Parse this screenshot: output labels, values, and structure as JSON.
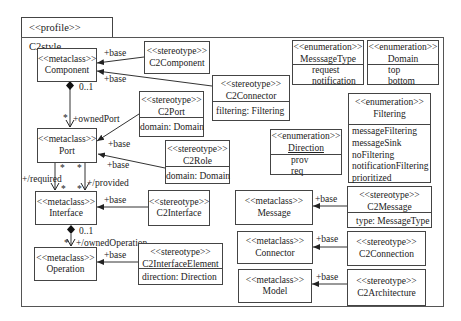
{
  "profile": {
    "tab_label": "<<profile>> C2style"
  },
  "metaclasses": [
    {
      "id": "component",
      "stereotype": "<<metaclass>>",
      "name": "Component"
    },
    {
      "id": "port",
      "stereotype": "<<metaclass>>",
      "name": "Port"
    },
    {
      "id": "interface",
      "stereotype": "<<metaclass>>",
      "name": "Interface"
    },
    {
      "id": "operation",
      "stereotype": "<<metaclass>>",
      "name": "Operation"
    },
    {
      "id": "message",
      "stereotype": "<<metaclass>>",
      "name": "Message"
    },
    {
      "id": "connector",
      "stereotype": "<<metaclass>>",
      "name": "Connector"
    },
    {
      "id": "model",
      "stereotype": "<<metaclass>>",
      "name": "Model"
    }
  ],
  "stereotypes": [
    {
      "id": "c2component",
      "stereotype": "<<stereotype>>",
      "name": "C2Component",
      "attributes": []
    },
    {
      "id": "c2connector",
      "stereotype": "<<stereotype>>",
      "name": "C2Connector",
      "attributes": [
        "filtering: Filtering"
      ]
    },
    {
      "id": "c2port",
      "stereotype": "<<stereotype>>",
      "name": "C2Port",
      "attributes": [
        "domain: Domain"
      ]
    },
    {
      "id": "c2role",
      "stereotype": "<<stereotype>>",
      "name": "C2Role",
      "attributes": [
        "domain: Domain"
      ]
    },
    {
      "id": "c2interface",
      "stereotype": "<<stereotype>>",
      "name": "C2Interface",
      "attributes": []
    },
    {
      "id": "c2interfaceelement",
      "stereotype": "<<stereotype>>",
      "name": "C2InterfaceElement",
      "attributes": [
        "direction: Direction"
      ]
    },
    {
      "id": "c2message",
      "stereotype": "<<stereotype>>",
      "name": "C2Message",
      "attributes": [
        "type: MessageType"
      ]
    },
    {
      "id": "c2connection",
      "stereotype": "<<stereotype>>",
      "name": "C2Connection",
      "attributes": []
    },
    {
      "id": "c2architecture",
      "stereotype": "<<stereotype>>",
      "name": "C2Architecture",
      "attributes": []
    }
  ],
  "enumerations": [
    {
      "id": "messagetype",
      "stereotype": "<<enumeration>>",
      "name": "MesssageType",
      "literals": [
        "request",
        "notification"
      ]
    },
    {
      "id": "domain",
      "stereotype": "<<enumeration>>",
      "name": "Domain",
      "literals": [
        "top",
        "bottom"
      ]
    },
    {
      "id": "filtering",
      "stereotype": "<<enumeration>>",
      "name": "Filtering",
      "literals": [
        "messageFiltering",
        "messageSink",
        "noFiltering",
        "notificationFiltering",
        "prioritized"
      ]
    },
    {
      "id": "direction",
      "stereotype": "<<enumeration>>",
      "name": "Direction",
      "literals": [
        "prov",
        "req"
      ]
    }
  ],
  "extensions": [
    {
      "from": "C2Component",
      "to": "Component",
      "label": "+base"
    },
    {
      "from": "C2Connector",
      "to": "Component",
      "label": "+base"
    },
    {
      "from": "C2Port",
      "to": "Port",
      "label": "+base"
    },
    {
      "from": "C2Role",
      "to": "Port",
      "label": "+base"
    },
    {
      "from": "C2Interface",
      "to": "Interface",
      "label": "+base"
    },
    {
      "from": "C2InterfaceElement",
      "to": "Operation",
      "label": "+base"
    },
    {
      "from": "C2Message",
      "to": "Message",
      "label": "+base"
    },
    {
      "from": "C2Connection",
      "to": "Connector",
      "label": "+base"
    },
    {
      "from": "C2Architecture",
      "to": "Model",
      "label": "+base"
    }
  ],
  "associations": {
    "owned_port": {
      "from": "Component",
      "to": "Port",
      "source_multiplicity": "0..1",
      "target_multiplicity": "*",
      "role": "+ownedPort"
    },
    "required": {
      "from": "Port",
      "to": "Interface",
      "source_multiplicity": "*",
      "target_multiplicity": "*",
      "role": "+/required"
    },
    "provided": {
      "from": "Port",
      "to": "Interface",
      "source_multiplicity": "*",
      "target_multiplicity": "*",
      "role": "+/provided"
    },
    "owned_operation": {
      "from": "Interface",
      "to": "Operation",
      "source_multiplicity": "0..1",
      "target_multiplicity": "*",
      "role": "+/ownedOperation"
    }
  }
}
